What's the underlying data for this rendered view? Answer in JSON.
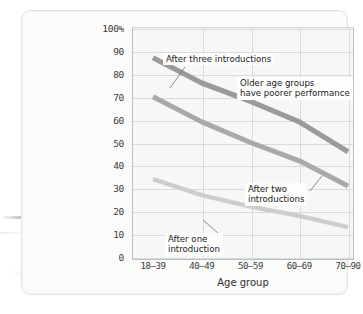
{
  "figure": {
    "y_axis_title": "Percentage\nof names\nrecalled",
    "x_axis_title": "Age group"
  },
  "annotations": {
    "three": "After three introductions",
    "older": "Older age groups\nhave poorer performance",
    "two": "After two\nintroductions",
    "one": "After one\nintroduction"
  },
  "colors": {
    "line_three": "#9a9a9a",
    "line_two": "#a9a9a9",
    "line_one": "#cdcdcd",
    "grid": "#d5dcdf",
    "axis": "#b9c2c6",
    "plot_bg": "#f7f7f5",
    "card_bg": "#fbfbf9",
    "text": "#2f2f2f"
  },
  "chart_data": {
    "type": "line",
    "title": "",
    "xlabel": "Age group",
    "ylabel": "Percentage of names recalled",
    "categories": [
      "18–39",
      "40–49",
      "50–59",
      "60–69",
      "70–90"
    ],
    "yticks": [
      "100%",
      "90",
      "80",
      "70",
      "60",
      "50",
      "40",
      "30",
      "20",
      "10",
      "0"
    ],
    "ylim": [
      0,
      100
    ],
    "grid": true,
    "legend": "annotations-inline",
    "series": [
      {
        "name": "After three introductions",
        "values": [
          87,
          76,
          68,
          59,
          46
        ]
      },
      {
        "name": "After two introductions",
        "values": [
          70,
          59,
          50,
          42,
          31
        ]
      },
      {
        "name": "After one introduction",
        "values": [
          34,
          27,
          22,
          18,
          13
        ]
      }
    ]
  }
}
